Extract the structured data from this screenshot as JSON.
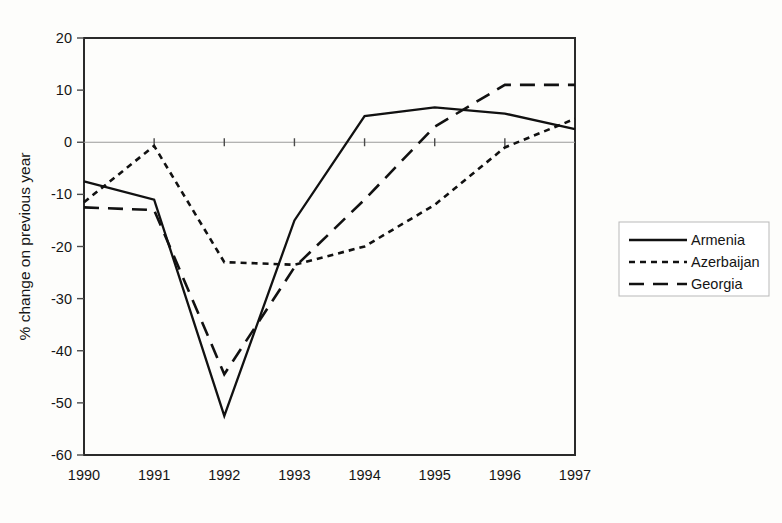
{
  "chart_data": {
    "type": "line",
    "title": "",
    "xlabel": "",
    "ylabel": "% change on previous year",
    "categories": [
      "1990",
      "1991",
      "1992",
      "1993",
      "1994",
      "1995",
      "1996",
      "1997"
    ],
    "x": [
      1990,
      1991,
      1992,
      1993,
      1994,
      1995,
      1996,
      1997
    ],
    "xlim": [
      1990,
      1997
    ],
    "ylim": [
      -60,
      20
    ],
    "yticks": [
      20,
      10,
      0,
      -10,
      -20,
      -30,
      -40,
      -50,
      -60
    ],
    "ytick_labels": [
      "20",
      "10",
      "0",
      "-10",
      "-20",
      "-30",
      "-40",
      "-50",
      "-60"
    ],
    "xtick_labels": [
      "1990",
      "1991",
      "1992",
      "1993",
      "1994",
      "1995",
      "1996",
      "1997"
    ],
    "grid": false,
    "zero_line": true,
    "legend_position": "right",
    "series": [
      {
        "name": "Armenia",
        "style": "solid",
        "color": "#111111",
        "values": [
          -7.5,
          -11.0,
          -52.5,
          -15.0,
          5.0,
          6.7,
          5.5,
          2.5
        ]
      },
      {
        "name": "Azerbaijan",
        "style": "dotted",
        "color": "#111111",
        "values": [
          -11.5,
          -0.7,
          -23.0,
          -23.5,
          -20.0,
          -12.0,
          -1.0,
          4.5
        ]
      },
      {
        "name": "Georgia",
        "style": "dashed",
        "color": "#111111",
        "values": [
          -12.5,
          -13.0,
          -44.5,
          -24.0,
          -11.0,
          3.0,
          11.0,
          11.0
        ]
      }
    ]
  },
  "legend": {
    "entries": [
      "Armenia",
      "Azerbaijan",
      "Georgia"
    ]
  },
  "axes": {
    "y_axis_title": "% change on previous year"
  }
}
